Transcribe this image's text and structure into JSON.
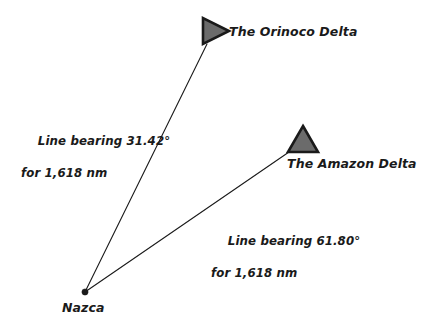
{
  "diagram": {
    "type": "bearing-map",
    "background_color": "#ffffff",
    "line_color": "#1a1a1a",
    "marker_fill_color": "#6b6b6b",
    "marker_stroke_color": "#1a1a1a",
    "text_color": "#1a1a1a",
    "origin": {
      "name": "origin-node",
      "label": "Nazca",
      "x": 85,
      "y": 292,
      "marker": "dot"
    },
    "destinations": [
      {
        "name": "orinoco-delta",
        "label": "The Orinoco Delta",
        "marker": "triangle-right",
        "marker_x": 215,
        "marker_y": 31,
        "anchor_x": 207,
        "anchor_y": 44
      },
      {
        "name": "amazon-delta",
        "label": "The Amazon Delta",
        "marker": "triangle-up",
        "marker_x": 303,
        "marker_y": 140,
        "anchor_x": 289,
        "anchor_y": 152
      }
    ],
    "bearings": [
      {
        "name": "bearing-orinoco",
        "line_1": "Line bearing 31.42°",
        "line_2": "for 1,618 nm",
        "bearing_deg": "31.42",
        "distance": "1,618",
        "distance_unit": "nm"
      },
      {
        "name": "bearing-amazon",
        "line_1": "Line bearing 61.80°",
        "line_2": "for 1,618 nm",
        "bearing_deg": "61.80",
        "distance": "1,618",
        "distance_unit": "nm"
      }
    ]
  }
}
